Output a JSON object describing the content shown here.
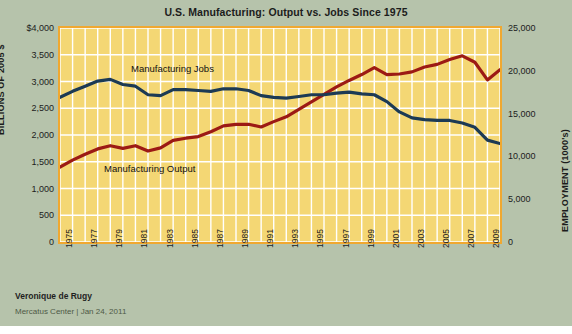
{
  "title": "U.S. Manufacturing: Output vs. Jobs Since 1975",
  "byline": "Veronique de Rugy",
  "source": "Mercatus Center | Jan 24, 2011",
  "axis": {
    "left_label": "BILLIONS OF 2005 $",
    "right_label": "EMPLOYMENT (1000's)",
    "left_ticks": [
      "$4,000",
      "3,500",
      "3,000",
      "2,500",
      "2,000",
      "1,500",
      "1,000",
      "500",
      "0"
    ],
    "right_ticks": [
      "25,000",
      "20,000",
      "15,000",
      "10,000",
      "5,000",
      "0"
    ]
  },
  "annotations": {
    "jobs": "Manufacturing Jobs",
    "output": "Manufacturing  Output"
  },
  "colors": {
    "background": "#b6c3ab",
    "plot_background": "#f4d774",
    "plot_border": "#f0a830",
    "gridline": "#ffffff",
    "jobs_line": "#1c3a54",
    "output_line": "#9c1a14",
    "text": "#1c1c1c"
  },
  "chart_data": {
    "type": "line",
    "title": "U.S. Manufacturing: Output vs. Jobs Since 1975",
    "xlabel": "",
    "grid": true,
    "legend": "inline-annotations",
    "x": [
      1975,
      1976,
      1977,
      1978,
      1979,
      1980,
      1981,
      1982,
      1983,
      1984,
      1985,
      1986,
      1987,
      1988,
      1989,
      1990,
      1991,
      1992,
      1993,
      1994,
      1995,
      1996,
      1997,
      1998,
      1999,
      2000,
      2001,
      2002,
      2003,
      2004,
      2005,
      2006,
      2007,
      2008,
      2009,
      2010
    ],
    "x_tick_labels": [
      "1975",
      "1977",
      "1979",
      "1981",
      "1983",
      "1985",
      "1987",
      "1989",
      "1991",
      "1993",
      "1995",
      "1997",
      "1999",
      "2001",
      "2003",
      "2005",
      "2007",
      "2009"
    ],
    "series": [
      {
        "name": "Manufacturing Output",
        "axis": "left",
        "ylabel": "BILLIONS OF 2005 $",
        "ylim": [
          0,
          4000
        ],
        "ytick_values": [
          0,
          500,
          1000,
          1500,
          2000,
          2500,
          3000,
          3500,
          4000
        ],
        "color": "#9c1a14",
        "values": [
          1400,
          1530,
          1640,
          1740,
          1800,
          1750,
          1800,
          1700,
          1760,
          1900,
          1940,
          1970,
          2060,
          2170,
          2200,
          2200,
          2150,
          2250,
          2340,
          2480,
          2620,
          2760,
          2900,
          3020,
          3130,
          3260,
          3130,
          3140,
          3180,
          3270,
          3320,
          3410,
          3480,
          3360,
          3030,
          3220
        ]
      },
      {
        "name": "Manufacturing Jobs",
        "axis": "right",
        "ylabel": "EMPLOYMENT (1000's)",
        "ylim": [
          0,
          25000
        ],
        "ytick_values": [
          0,
          5000,
          10000,
          15000,
          20000,
          25000
        ],
        "color": "#1c3a54",
        "values": [
          16900,
          17600,
          18200,
          18800,
          19000,
          18400,
          18200,
          17200,
          17100,
          17800,
          17800,
          17700,
          17600,
          17900,
          17900,
          17700,
          17100,
          16900,
          16800,
          17000,
          17200,
          17200,
          17400,
          17500,
          17300,
          17200,
          16400,
          15200,
          14500,
          14300,
          14200,
          14200,
          13900,
          13400,
          11900,
          11500
        ]
      }
    ]
  }
}
